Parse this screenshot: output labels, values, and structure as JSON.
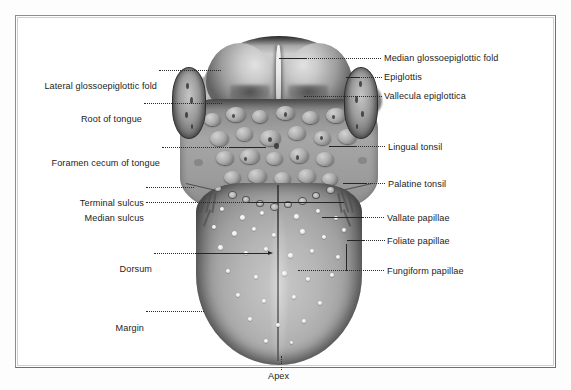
{
  "figure": {
    "title_visible": false,
    "view": "Dorsum of the tongue, superior view",
    "style": "grayscale halftone anatomical photograph with dotted leader lines",
    "frame_color": "#8d8d8d",
    "background_color": "#ffffff",
    "text_color": "#1c1c1c"
  },
  "labels": {
    "median_glossoepiglottic_fold": "Median glossoepiglottic fold",
    "epiglottis": "Epiglottis",
    "vallecula_epiglottica": "Vallecula epiglottica",
    "lingual_tonsil": "Lingual tonsil",
    "palatine_tonsil": "Palatine tonsil",
    "vallate_papillae": "Vallate papillae",
    "foliate_papillae": "Foliate papillae",
    "fungiform_papillae": "Fungiform papillae",
    "lateral_glossoepiglottic_fold": "Lateral glossoepiglottic fold",
    "root_of_tongue": "Root of tongue",
    "foramen_cecum_of_tongue": "Foramen cecum of tongue",
    "terminal_sulcus": "Terminal sulcus",
    "median_sulcus": "Median sulcus",
    "dorsum": "Dorsum",
    "margin": "Margin",
    "apex": "Apex"
  },
  "label_list": [
    {
      "key": "lateral_glossoepiglottic_fold",
      "text": "Lateral glossoepiglottic fold",
      "side": "left"
    },
    {
      "key": "root_of_tongue",
      "text": "Root of tongue",
      "side": "left"
    },
    {
      "key": "foramen_cecum_of_tongue",
      "text": "Foramen cecum of tongue",
      "side": "left"
    },
    {
      "key": "terminal_sulcus",
      "text": "Terminal sulcus",
      "side": "left"
    },
    {
      "key": "median_sulcus",
      "text": "Median sulcus",
      "side": "left"
    },
    {
      "key": "dorsum",
      "text": "Dorsum",
      "side": "left"
    },
    {
      "key": "margin",
      "text": "Margin",
      "side": "left"
    },
    {
      "key": "median_glossoepiglottic_fold",
      "text": "Median glossoepiglottic fold",
      "side": "right"
    },
    {
      "key": "epiglottis",
      "text": "Epiglottis",
      "side": "right"
    },
    {
      "key": "vallecula_epiglottica",
      "text": "Vallecula epiglottica",
      "side": "right"
    },
    {
      "key": "lingual_tonsil",
      "text": "Lingual tonsil",
      "side": "right"
    },
    {
      "key": "palatine_tonsil",
      "text": "Palatine tonsil",
      "side": "right"
    },
    {
      "key": "vallate_papillae",
      "text": "Vallate papillae",
      "side": "right"
    },
    {
      "key": "foliate_papillae",
      "text": "Foliate papillae",
      "side": "right"
    },
    {
      "key": "fungiform_papillae",
      "text": "Fungiform papillae",
      "side": "right"
    },
    {
      "key": "apex",
      "text": "Apex",
      "side": "bottom"
    }
  ]
}
